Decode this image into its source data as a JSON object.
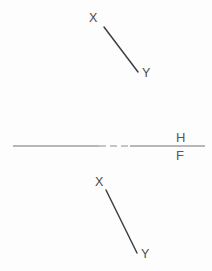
{
  "drawing": {
    "title": "Descriptive geometry line projection",
    "background_color": "#fdfdfd",
    "line_color": "#3c3c42",
    "label_color": "#4a4a52",
    "fold_line_color": "#72727a",
    "top_view": {
      "name": "horizontal-projection",
      "label_start": "X",
      "label_end": "Y",
      "start_point": {
        "x": 104,
        "y": 27
      },
      "end_point": {
        "x": 138,
        "y": 72
      },
      "start_label_pos": {
        "x": 89,
        "y": 22
      },
      "end_label_pos": {
        "x": 142,
        "y": 77
      }
    },
    "front_view": {
      "name": "frontal-projection",
      "label_start": "X",
      "label_end": "Y",
      "start_point": {
        "x": 106,
        "y": 190
      },
      "end_point": {
        "x": 137,
        "y": 253
      },
      "start_label_pos": {
        "x": 95,
        "y": 186
      },
      "end_label_pos": {
        "x": 141,
        "y": 258
      }
    },
    "fold_line": {
      "name": "H-F reference line",
      "upper_label": "H",
      "lower_label": "F",
      "y": 146,
      "x_start": 13,
      "x_end": 205,
      "dash_x_start": 99,
      "dash_x_end": 130,
      "upper_label_pos": {
        "x": 176,
        "y": 142
      },
      "lower_label_pos": {
        "x": 176,
        "y": 160
      }
    }
  }
}
